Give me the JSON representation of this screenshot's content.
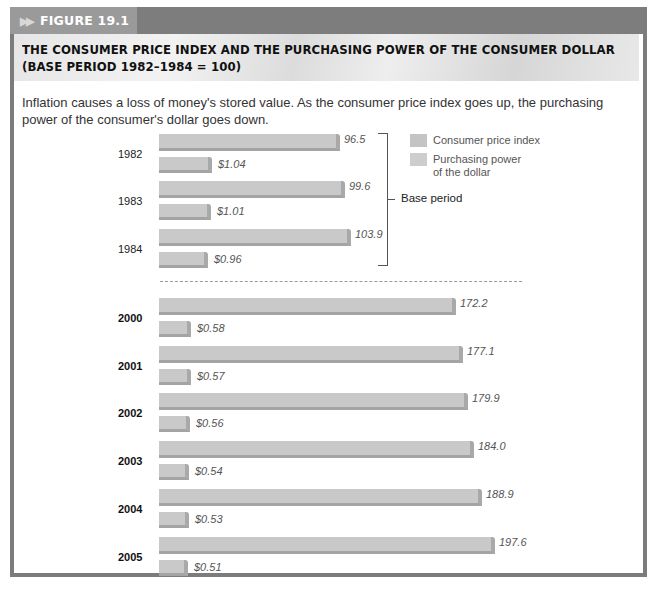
{
  "figure": {
    "tab_label": "FIGURE 19.1",
    "arrows": "▶▶",
    "title_line1": "THE CONSUMER PRICE INDEX AND THE PURCHASING POWER OF THE CONSUMER DOLLAR",
    "title_line2": "(BASE PERIOD 1982–1984 = 100)",
    "caption": "Inflation causes a loss of money's stored value. As the consumer price index goes up, the purchasing power of the consumer's dollar goes down."
  },
  "legend": {
    "cpi": "Consumer price index",
    "usd_line1": "Purchasing power",
    "usd_line2": "of the dollar",
    "cpi_color": "#c6c6c6",
    "usd_color": "#cdcdcd"
  },
  "base_period_label": "Base period",
  "rows": [
    {
      "year": "1982",
      "cpi": "96.5",
      "usd": "$1.04"
    },
    {
      "year": "1983",
      "cpi": "99.6",
      "usd": "$1.01"
    },
    {
      "year": "1984",
      "cpi": "103.9",
      "usd": "$0.96"
    },
    {
      "year": "2000",
      "cpi": "172.2",
      "usd": "$0.58"
    },
    {
      "year": "2001",
      "cpi": "177.1",
      "usd": "$0.57"
    },
    {
      "year": "2002",
      "cpi": "179.9",
      "usd": "$0.56"
    },
    {
      "year": "2003",
      "cpi": "184.0",
      "usd": "$0.54"
    },
    {
      "year": "2004",
      "cpi": "188.9",
      "usd": "$0.53"
    },
    {
      "year": "2005",
      "cpi": "197.6",
      "usd": "$0.51"
    }
  ],
  "chart_data": {
    "type": "bar",
    "orientation": "horizontal",
    "title": "The Consumer Price Index and the Purchasing Power of the Consumer Dollar (Base Period 1982–1984 = 100)",
    "subtitle": "Inflation causes a loss of money's stored value. As the consumer price index goes up, the purchasing power of the consumer's dollar goes down.",
    "categories": [
      "1982",
      "1983",
      "1984",
      "2000",
      "2001",
      "2002",
      "2003",
      "2004",
      "2005"
    ],
    "series": [
      {
        "name": "Consumer price index",
        "values": [
          96.5,
          99.6,
          103.9,
          172.2,
          177.1,
          179.9,
          184.0,
          188.9,
          197.6
        ]
      },
      {
        "name": "Purchasing power of the dollar",
        "unit": "$",
        "values": [
          1.04,
          1.01,
          0.96,
          0.58,
          0.57,
          0.56,
          0.54,
          0.53,
          0.51
        ]
      }
    ],
    "annotations": [
      "Base period (1982–1984 bracketed)",
      "Dashed separator between 1984 and 2000"
    ],
    "legend_position": "top-right",
    "grid": false,
    "xlabel": "",
    "ylabel": ""
  }
}
